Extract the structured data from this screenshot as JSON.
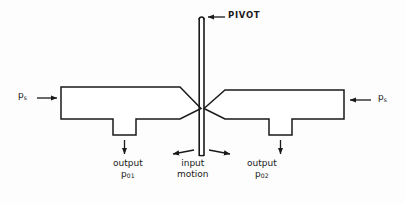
{
  "figure": {
    "background_color": "#fdfdfd",
    "line_color": "#1a1a1a"
  },
  "labels": {
    "pivot": "PIVOT",
    "supply_left": "p",
    "supply_left_sub": "s",
    "supply_right": "p",
    "supply_right_sub": "s",
    "output_left_word": "output",
    "output_left_sym": "p",
    "output_left_sub": "0",
    "output_left_subsub": "1",
    "output_right_word": "output",
    "output_right_sym": "p",
    "output_right_sub": "0",
    "output_right_subsub": "2",
    "input_line1": "input",
    "input_line2": "motion"
  },
  "icons": {
    "supply_left_arrow": "arrow-right-icon",
    "supply_right_arrow": "arrow-left-icon",
    "output_left_arrow": "arrow-down-icon",
    "output_right_arrow": "arrow-down-icon",
    "pivot_pointer": "arrow-left-icon",
    "motion_arrow_left": "arrow-left-icon",
    "motion_arrow_right": "arrow-right-icon"
  }
}
